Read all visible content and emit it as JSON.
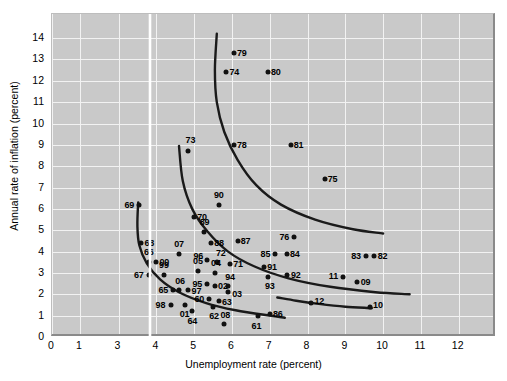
{
  "chart_data": {
    "type": "scatter",
    "title": "",
    "xlabel": "Unemployment rate (percent)",
    "ylabel": "Annual rate of inflation (percent)",
    "xlim": [
      0,
      12.6
    ],
    "ylim": [
      0,
      14.6
    ],
    "xticks": [
      "0",
      "1",
      "3",
      "4",
      "5",
      "6",
      "7",
      "8",
      "9",
      "10",
      "11",
      "12"
    ],
    "yticks": [
      "0",
      "1",
      "2",
      "3",
      "4",
      "5",
      "6",
      "7",
      "8",
      "9",
      "10",
      "11",
      "12",
      "13",
      "14"
    ],
    "axis_break": {
      "present": true,
      "between": [
        1,
        3
      ],
      "style": "wavy-white-line"
    },
    "grid": true,
    "legend": "none",
    "plot_background": "#c9c9c9",
    "gridline_color": "#f2f2f2",
    "marker_color": "#111111",
    "curve_color": "#1a1a1a",
    "points": [
      {
        "label": "79",
        "x": 6.05,
        "y": 13.3,
        "lab_dx": 8,
        "lab_dy": 0
      },
      {
        "label": "74",
        "x": 5.85,
        "y": 12.4,
        "lab_dx": 8,
        "lab_dy": 0
      },
      {
        "label": "80",
        "x": 6.95,
        "y": 12.4,
        "lab_dx": 8,
        "lab_dy": 0
      },
      {
        "label": "73",
        "x": 4.85,
        "y": 8.7,
        "lab_dx": 2,
        "lab_dy": -11
      },
      {
        "label": "78",
        "x": 6.05,
        "y": 9.0,
        "lab_dx": 8,
        "lab_dy": 0
      },
      {
        "label": "81",
        "x": 7.55,
        "y": 9.0,
        "lab_dx": 8,
        "lab_dy": 0
      },
      {
        "label": "75",
        "x": 8.45,
        "y": 7.4,
        "lab_dx": 8,
        "lab_dy": 0
      },
      {
        "label": "90",
        "x": 5.65,
        "y": 6.2,
        "lab_dx": 0,
        "lab_dy": -10
      },
      {
        "label": "69",
        "x": 3.55,
        "y": 6.2,
        "lab_dx": -10,
        "lab_dy": 0
      },
      {
        "label": "70",
        "x": 5.0,
        "y": 5.6,
        "lab_dx": 8,
        "lab_dy": 0
      },
      {
        "label": "68",
        "x": 3.6,
        "y": 4.4,
        "lab_dx": 8,
        "lab_dy": 0
      },
      {
        "label": "89",
        "x": 5.25,
        "y": 4.9,
        "lab_dx": 1,
        "lab_dy": -10
      },
      {
        "label": "88",
        "x": 5.45,
        "y": 4.4,
        "lab_dx": 8,
        "lab_dy": 0
      },
      {
        "label": "87",
        "x": 6.15,
        "y": 4.5,
        "lab_dx": 8,
        "lab_dy": 0
      },
      {
        "label": "76",
        "x": 7.65,
        "y": 4.7,
        "lab_dx": -10,
        "lab_dy": 0
      },
      {
        "label": "07",
        "x": 4.6,
        "y": 3.9,
        "lab_dx": 0,
        "lab_dy": -10
      },
      {
        "label": "85",
        "x": 7.15,
        "y": 3.9,
        "lab_dx": -10,
        "lab_dy": 0
      },
      {
        "label": "84",
        "x": 7.45,
        "y": 3.9,
        "lab_dx": 8,
        "lab_dy": 0
      },
      {
        "label": "66",
        "x": 3.8,
        "y": 3.5,
        "lab_dx": 0,
        "lab_dy": -10
      },
      {
        "label": "00",
        "x": 4.0,
        "y": 3.5,
        "lab_dx": 8,
        "lab_dy": 0
      },
      {
        "label": "96",
        "x": 5.35,
        "y": 3.6,
        "lab_dx": -9,
        "lab_dy": -4
      },
      {
        "label": "72",
        "x": 5.6,
        "y": 3.5,
        "lab_dx": 4,
        "lab_dy": -9
      },
      {
        "label": "71",
        "x": 5.95,
        "y": 3.4,
        "lab_dx": 8,
        "lab_dy": 0
      },
      {
        "label": "83",
        "x": 9.55,
        "y": 3.8,
        "lab_dx": -10,
        "lab_dy": 0
      },
      {
        "label": "82",
        "x": 9.75,
        "y": 3.8,
        "lab_dx": 9,
        "lab_dy": 0
      },
      {
        "label": "67",
        "x": 3.8,
        "y": 2.9,
        "lab_dx": -10,
        "lab_dy": 0
      },
      {
        "label": "99",
        "x": 4.2,
        "y": 2.9,
        "lab_dx": 0,
        "lab_dy": -10
      },
      {
        "label": "05",
        "x": 5.1,
        "y": 3.1,
        "lab_dx": 0,
        "lab_dy": -10
      },
      {
        "label": "04",
        "x": 5.55,
        "y": 3.0,
        "lab_dx": 1,
        "lab_dy": -10
      },
      {
        "label": "91",
        "x": 6.85,
        "y": 3.3,
        "lab_dx": 8,
        "lab_dy": 0
      },
      {
        "label": "92",
        "x": 7.45,
        "y": 2.9,
        "lab_dx": 9,
        "lab_dy": 0
      },
      {
        "label": "93",
        "x": 6.95,
        "y": 2.8,
        "lab_dx": 2,
        "lab_dy": 9
      },
      {
        "label": "11",
        "x": 8.95,
        "y": 2.8,
        "lab_dx": -10,
        "lab_dy": -1
      },
      {
        "label": "09",
        "x": 9.3,
        "y": 2.6,
        "lab_dx": 9,
        "lab_dy": 0
      },
      {
        "label": "95",
        "x": 5.35,
        "y": 2.5,
        "lab_dx": -10,
        "lab_dy": 0
      },
      {
        "label": "02",
        "x": 5.55,
        "y": 2.4,
        "lab_dx": 8,
        "lab_dy": 0
      },
      {
        "label": "94",
        "x": 5.9,
        "y": 2.4,
        "lab_dx": 2,
        "lab_dy": -9
      },
      {
        "label": "03",
        "x": 5.9,
        "y": 2.1,
        "lab_dx": 9,
        "lab_dy": 2
      },
      {
        "label": "65",
        "x": 4.45,
        "y": 2.2,
        "lab_dx": -10,
        "lab_dy": 0
      },
      {
        "label": "06",
        "x": 4.6,
        "y": 2.2,
        "lab_dx": 1,
        "lab_dy": -9
      },
      {
        "label": "97",
        "x": 4.85,
        "y": 2.2,
        "lab_dx": 8,
        "lab_dy": 1
      },
      {
        "label": "60",
        "x": 5.4,
        "y": 1.8,
        "lab_dx": -10,
        "lab_dy": 0
      },
      {
        "label": "63",
        "x": 5.65,
        "y": 1.7,
        "lab_dx": 8,
        "lab_dy": 1
      },
      {
        "label": "62",
        "x": 5.5,
        "y": 1.4,
        "lab_dx": 1,
        "lab_dy": 9
      },
      {
        "label": "98",
        "x": 4.4,
        "y": 1.5,
        "lab_dx": -11,
        "lab_dy": 0
      },
      {
        "label": "01",
        "x": 4.75,
        "y": 1.5,
        "lab_dx": 0,
        "lab_dy": 9
      },
      {
        "label": "64",
        "x": 4.95,
        "y": 1.2,
        "lab_dx": 0,
        "lab_dy": 10
      },
      {
        "label": "12",
        "x": 8.1,
        "y": 1.6,
        "lab_dx": 8,
        "lab_dy": -2
      },
      {
        "label": "10",
        "x": 9.65,
        "y": 1.4,
        "lab_dx": 8,
        "lab_dy": -2
      },
      {
        "label": "86",
        "x": 7.0,
        "y": 1.1,
        "lab_dx": 8,
        "lab_dy": 0
      },
      {
        "label": "61",
        "x": 6.7,
        "y": 1.0,
        "lab_dx": -2,
        "lab_dy": 10
      },
      {
        "label": "08",
        "x": 5.8,
        "y": 0.6,
        "lab_dx": 1,
        "lab_dy": -9
      }
    ],
    "curves": [
      {
        "name": "phillips-curve-1970s",
        "points": [
          [
            5.6,
            14.2
          ],
          [
            5.55,
            12.5
          ],
          [
            5.6,
            11.0
          ],
          [
            5.8,
            9.6
          ],
          [
            6.15,
            8.3
          ],
          [
            6.65,
            7.1
          ],
          [
            7.3,
            6.2
          ],
          [
            8.2,
            5.5
          ],
          [
            9.2,
            5.05
          ],
          [
            10.0,
            4.85
          ]
        ]
      },
      {
        "name": "phillips-curve-1990s",
        "points": [
          [
            4.6,
            8.95
          ],
          [
            4.7,
            7.3
          ],
          [
            4.95,
            6.0
          ],
          [
            5.35,
            4.95
          ],
          [
            5.9,
            4.0
          ],
          [
            6.6,
            3.3
          ],
          [
            7.5,
            2.75
          ],
          [
            8.6,
            2.35
          ],
          [
            9.8,
            2.1
          ],
          [
            10.7,
            2.0
          ]
        ]
      },
      {
        "name": "phillips-curve-1960s",
        "points": [
          [
            3.52,
            6.3
          ],
          [
            3.5,
            5.2
          ],
          [
            3.55,
            4.3
          ],
          [
            3.75,
            3.45
          ],
          [
            4.1,
            2.7
          ],
          [
            4.6,
            2.1
          ],
          [
            5.3,
            1.6
          ],
          [
            6.1,
            1.25
          ],
          [
            7.0,
            1.0
          ],
          [
            7.4,
            0.9
          ]
        ]
      },
      {
        "name": "phillips-curve-2010s",
        "points": [
          [
            7.2,
            1.85
          ],
          [
            7.7,
            1.7
          ],
          [
            8.3,
            1.55
          ],
          [
            9.0,
            1.42
          ],
          [
            9.7,
            1.35
          ]
        ]
      }
    ]
  }
}
